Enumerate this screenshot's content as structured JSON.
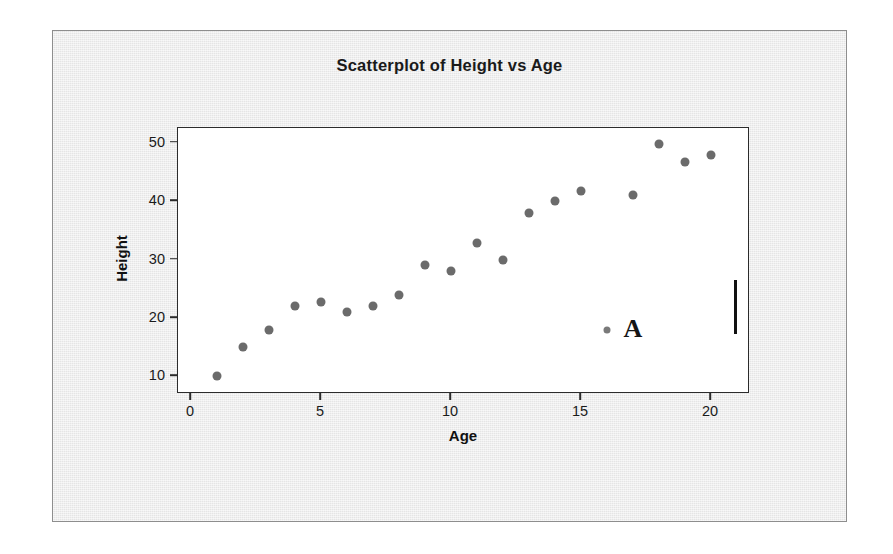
{
  "chart_data": {
    "type": "scatter",
    "title": "Scatterplot of Height vs Age",
    "xlabel": "Age",
    "ylabel": "Height",
    "xlim": [
      -0.5,
      21.5
    ],
    "ylim": [
      7.0,
      52.5
    ],
    "xticks": [
      0,
      5,
      10,
      15,
      20
    ],
    "yticks": [
      10,
      20,
      30,
      40,
      50
    ],
    "xtick_labels": [
      "0",
      "5",
      "10",
      "15",
      "20"
    ],
    "ytick_labels": [
      "10",
      "20",
      "30",
      "40",
      "50"
    ],
    "grid": false,
    "legend": false,
    "marker_color": "#6b6b6b",
    "frame_color": "#2b2b2b",
    "background_color": "#ebebeb",
    "plot_background_color": "#ffffff",
    "series": [
      {
        "name": "Height vs Age",
        "x": [
          1,
          2,
          3,
          4,
          5,
          6,
          7,
          8,
          9,
          10,
          11,
          12,
          13,
          14,
          15,
          16,
          17,
          18,
          19,
          20
        ],
        "y": [
          10.0,
          15.0,
          18.0,
          22.0,
          22.8,
          21.0,
          22.0,
          24.0,
          29.0,
          28.0,
          32.8,
          30.0,
          38.0,
          40.0,
          41.7,
          18.0,
          41.0,
          49.7,
          46.7,
          47.8
        ]
      }
    ],
    "annotations": [
      {
        "text": "A",
        "x": 17.0,
        "y": 18.2,
        "describes_point": {
          "x": 16,
          "y": 18.0
        }
      }
    ]
  },
  "artifacts": {
    "cursor_bar": {
      "name": "text-cursor",
      "x": 20.9,
      "y_top": 26.5,
      "y_bottom": 17.3
    }
  }
}
